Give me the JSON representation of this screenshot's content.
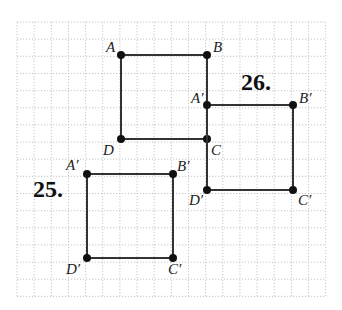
{
  "diagram": {
    "type": "coordinate-grid-translation",
    "grid": {
      "left": 17,
      "top": 22,
      "cell": 17.15,
      "cols": 18,
      "rows": 16,
      "line_color": "#b8b8b8"
    },
    "colors": {
      "segment": "#333333",
      "point": "#111111"
    },
    "figures": [
      {
        "id": "original",
        "points": [
          {
            "name": "A",
            "label": "A",
            "x": 121,
            "y": 55,
            "lx": 106,
            "ly": 52
          },
          {
            "name": "B",
            "label": "B",
            "x": 207,
            "y": 55,
            "lx": 213,
            "ly": 52
          },
          {
            "name": "C",
            "label": "C",
            "x": 207,
            "y": 139,
            "lx": 211,
            "ly": 155
          },
          {
            "name": "D",
            "label": "D",
            "x": 121,
            "y": 139,
            "lx": 103,
            "ly": 155
          }
        ]
      },
      {
        "id": "image-26",
        "number_label": "26.",
        "number_pos": {
          "x": 241,
          "y": 90
        },
        "points": [
          {
            "name": "A'",
            "label": "A′",
            "x": 207,
            "y": 105,
            "lx": 191,
            "ly": 103
          },
          {
            "name": "B'",
            "label": "B′",
            "x": 293,
            "y": 105,
            "lx": 299,
            "ly": 103
          },
          {
            "name": "C'",
            "label": "C′",
            "x": 293,
            "y": 190,
            "lx": 298,
            "ly": 205
          },
          {
            "name": "D'",
            "label": "D′",
            "x": 207,
            "y": 190,
            "lx": 189,
            "ly": 205
          }
        ]
      },
      {
        "id": "image-25",
        "number_label": "25.",
        "number_pos": {
          "x": 33,
          "y": 197
        },
        "points": [
          {
            "name": "A'",
            "label": "A′",
            "x": 87,
            "y": 174,
            "lx": 66,
            "ly": 170
          },
          {
            "name": "B'",
            "label": "B′",
            "x": 173,
            "y": 174,
            "lx": 177,
            "ly": 171
          },
          {
            "name": "C'",
            "label": "C′",
            "x": 173,
            "y": 258,
            "lx": 168,
            "ly": 274
          },
          {
            "name": "D'",
            "label": "D′",
            "x": 87,
            "y": 258,
            "lx": 66,
            "ly": 274
          }
        ]
      }
    ]
  }
}
